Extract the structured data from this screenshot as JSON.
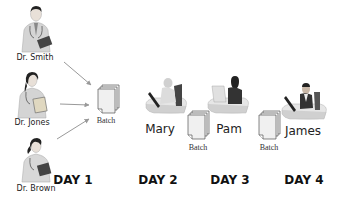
{
  "diagram": {
    "type": "workflow",
    "doctors": [
      {
        "name": "Dr. Smith",
        "icon": "doctor-male-icon"
      },
      {
        "name": "Dr. Jones",
        "icon": "doctor-female-icon"
      },
      {
        "name": "Dr. Brown",
        "icon": "doctor-female-icon"
      }
    ],
    "batches": [
      {
        "label": "Batch",
        "icon": "document-stack-icon"
      },
      {
        "label": "Batch",
        "icon": "document-stack-icon"
      },
      {
        "label": "Batch",
        "icon": "document-stack-icon"
      }
    ],
    "workers": [
      {
        "name": "Mary",
        "icon": "worker-at-desk-icon"
      },
      {
        "name": "Pam",
        "icon": "worker-at-desk-icon"
      },
      {
        "name": "James",
        "icon": "worker-at-desk-icon"
      }
    ],
    "days": [
      "DAY 1",
      "DAY 2",
      "DAY 3",
      "DAY 4"
    ],
    "colors": {
      "arrow": "#999999",
      "text": "#222222",
      "document_fill": "#f0f0f0",
      "document_stroke": "#555555",
      "figure_gray": "#c8c8c8",
      "figure_dark": "#333333"
    }
  }
}
